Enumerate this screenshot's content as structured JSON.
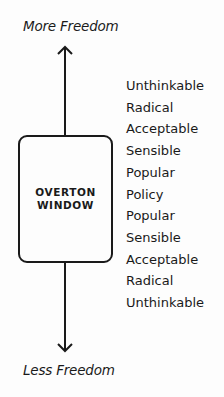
{
  "labels": {
    "top": "More Freedom",
    "bottom": "Less Freedom"
  },
  "box": {
    "line1": "OVERTON",
    "line2": "WINDOW"
  },
  "scale": [
    "Unthinkable",
    "Radical",
    "Acceptable",
    "Sensible",
    "Popular",
    "Policy",
    "Popular",
    "Sensible",
    "Acceptable",
    "Radical",
    "Unthinkable"
  ],
  "colors": {
    "stroke": "#1a1a1a",
    "background": "#fdfdfd"
  }
}
